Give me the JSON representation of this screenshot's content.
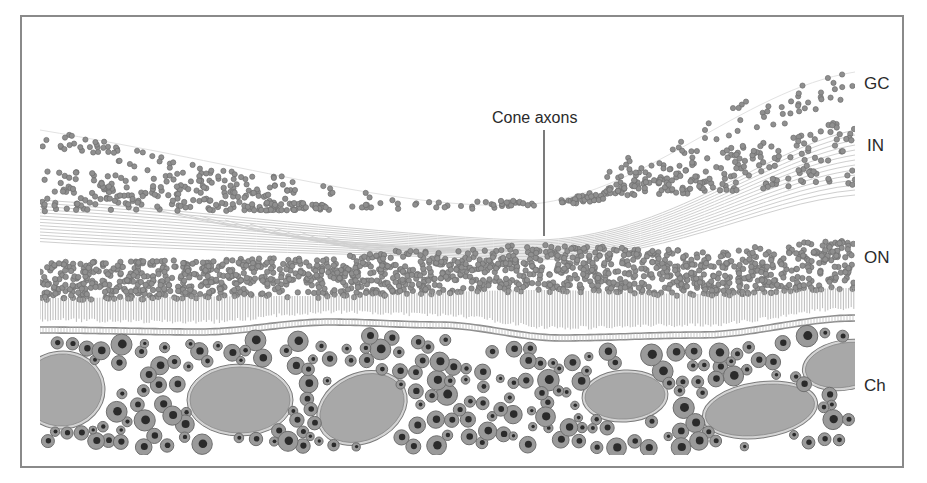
{
  "figure": {
    "type": "retina cross-section illustration",
    "annotation": {
      "text": "Cone axons",
      "x": 492,
      "y": 110,
      "pointer": {
        "x": 544,
        "y1": 130,
        "y2": 236
      }
    },
    "layer_labels": [
      {
        "id": "gc",
        "text": "GC",
        "x": 864,
        "y": 75
      },
      {
        "id": "in",
        "text": "IN",
        "x": 867,
        "y": 137
      },
      {
        "id": "on",
        "text": "ON",
        "x": 864,
        "y": 249
      },
      {
        "id": "ch",
        "text": "Ch",
        "x": 864,
        "y": 377
      }
    ],
    "colors": {
      "frame": "#8a8a8a",
      "nucleus_fill": "#8f8f8f",
      "nucleus_stroke": "#6f6f6f",
      "fiber": "#cfcfcf",
      "membrane": "#8c8c8c",
      "choroid_cell": "#9a9a9a",
      "choroid_cell_rim": "#6e6e6e",
      "choroid_nucleus": "#2b2b2b",
      "vessel_fill": "#a8a8a8",
      "vessel_rim": "#d4d4d4",
      "vessel_stroke": "#7a7a7a"
    },
    "extent": {
      "x0": 40,
      "x1": 855
    }
  }
}
